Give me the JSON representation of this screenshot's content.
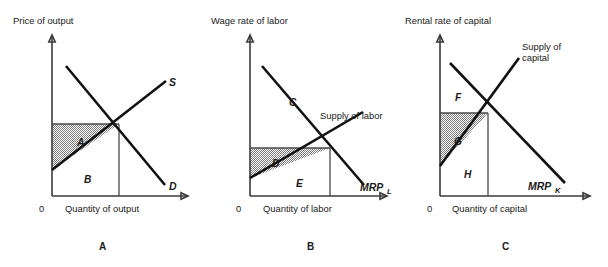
{
  "figure": {
    "panels": [
      {
        "caption": "A",
        "y_axis_title": "Price of output",
        "x_axis_title": "Quantity of output",
        "origin": "0",
        "demand_label": "D",
        "supply_label": "S",
        "supply_label_sub": "",
        "demand_label_sub": "",
        "regions": [
          {
            "id": "A",
            "label": "A",
            "shaded": true
          },
          {
            "id": "B",
            "label": "B",
            "shaded": false
          }
        ]
      },
      {
        "caption": "B",
        "y_axis_title": "Wage rate of labor",
        "x_axis_title": "Quantity of labor",
        "origin": "0",
        "demand_label": "MRP",
        "demand_label_sub": "L",
        "supply_label_line1": "Supply of labor",
        "supply_label_line2": "",
        "regions": [
          {
            "id": "C",
            "label": "C",
            "shaded": false
          },
          {
            "id": "D",
            "label": "D",
            "shaded": true
          },
          {
            "id": "E",
            "label": "E",
            "shaded": false
          }
        ]
      },
      {
        "caption": "C",
        "y_axis_title": "Rental rate of capital",
        "x_axis_title": "Quantity of capital",
        "origin": "0",
        "demand_label": "MRP",
        "demand_label_sub": "K",
        "supply_label_line1": "Supply of",
        "supply_label_line2": "capital",
        "regions": [
          {
            "id": "F",
            "label": "F",
            "shaded": false
          },
          {
            "id": "G",
            "label": "G",
            "shaded": true
          },
          {
            "id": "H",
            "label": "H",
            "shaded": false
          }
        ]
      }
    ],
    "colors": {
      "curve": "#121212",
      "axis": "#3a3a3a",
      "shading": "#808080",
      "background": "#ffffff"
    }
  }
}
